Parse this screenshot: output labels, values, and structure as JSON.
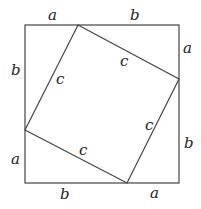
{
  "diagram": {
    "title": "",
    "outer_square": {
      "x1": 25,
      "y1": 25,
      "x2": 179,
      "y2": 183
    },
    "inner_square": [
      [
        78,
        25
      ],
      [
        179,
        79
      ],
      [
        127,
        183
      ],
      [
        25,
        130
      ]
    ],
    "labels": {
      "top_left": "a",
      "top_right": "b",
      "right_top": "a",
      "right_bottom": "b",
      "bottom_right": "a",
      "bottom_left": "b",
      "left_bottom": "a",
      "left_top": "b",
      "inner_top_right": "c",
      "inner_left": "c",
      "inner_right": "c",
      "inner_bottom": "c"
    }
  }
}
